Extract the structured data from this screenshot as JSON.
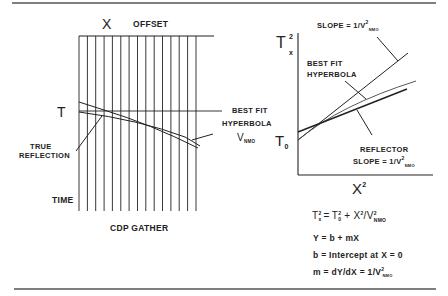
{
  "figure": {
    "left_panel": {
      "title_axis_symbol": "X",
      "title_axis_label": "OFFSET",
      "time_symbol": "T",
      "time_axis_label": "TIME",
      "caption": "CDP GATHER",
      "true_reflection_label_line1": "TRUE",
      "true_reflection_label_line2": "REFLECTION",
      "best_fit_label_line1": "BEST FIT",
      "best_fit_label_line2": "HYPERBOLA",
      "velocity_symbol": "V",
      "velocity_subscript": "NMO",
      "trace_count": 15
    },
    "right_panel": {
      "y_axis_symbol": "T",
      "y_axis_superscript": "2",
      "y_axis_subscript": "x",
      "x_axis_symbol": "X",
      "x_axis_superscript": "2",
      "intercept_symbol": "T",
      "intercept_subscript": "0",
      "slope_top_label": "SLOPE = 1/V",
      "slope_top_superscript": "2",
      "slope_top_subscript": "NMO",
      "best_fit_label_line1": "BEST FIT",
      "best_fit_label_line2": "HYPERBOLA",
      "reflector_label_line1": "REFLECTOR",
      "reflector_label_line2": "SLOPE = 1/V",
      "reflector_superscript": "2",
      "reflector_subscript": "NMO"
    },
    "equations": {
      "eq1": "T²x = T²0 + X²/V²NMO",
      "eq1_parts": {
        "lhs": "T",
        "lhs_sup": "2",
        "lhs_sub": "x",
        "eq": "=",
        "t0": "T",
        "t0_sup": "2",
        "t0_sub": "0",
        "plus": "+",
        "x": "X",
        "x_sup": "2",
        "div": "/V",
        "v_sup": "2",
        "v_sub": "NMO"
      },
      "eq2": "Y = b + mX",
      "eq3": "b = Intercept at X = 0",
      "eq4_prefix": "m = dY/dX = 1/V",
      "eq4_sup": "2",
      "eq4_sub": "NMO"
    }
  }
}
